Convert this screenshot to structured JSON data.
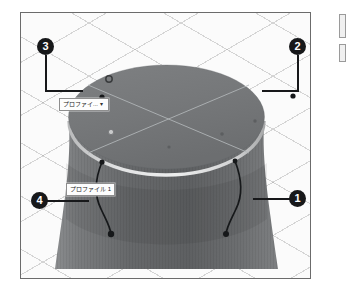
{
  "viewport": {
    "name": "3d-model-viewport",
    "background_color": "#fbfbfb",
    "grid_color": "#969696",
    "border_color": "#6b6b6b"
  },
  "model": {
    "description": "Shaded 3D revolved solid: cylinder with concave waist",
    "body_color": "#6f7173",
    "top_face_color": "#77797b",
    "highlight_color": "#d9dadb",
    "sketch_line_color": "#9aa0a2"
  },
  "callouts": [
    {
      "id": "callout-1",
      "number": "1"
    },
    {
      "id": "callout-2",
      "number": "2"
    },
    {
      "id": "callout-3",
      "number": "3"
    },
    {
      "id": "callout-4",
      "number": "4"
    }
  ],
  "sketch_labels": [
    {
      "id": "profile-dropdown",
      "text": "プロファイ...",
      "dropdown_glyph": "▾"
    },
    {
      "id": "profile-1-label",
      "text": "プロファイル 1"
    }
  ],
  "edge_widgets": [
    {
      "id": "edge-chip-top"
    },
    {
      "id": "edge-chip-bottom"
    }
  ]
}
